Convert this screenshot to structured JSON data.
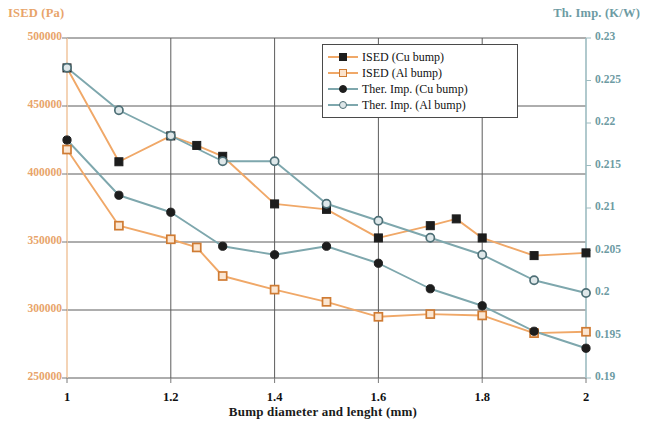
{
  "left_axis": {
    "title": "ISED (Pa)",
    "color": "#e8a46a",
    "ticks": [
      "500000",
      "450000",
      "400000",
      "350000",
      "300000",
      "250000"
    ]
  },
  "right_axis": {
    "title": "Th. Imp. (K/W)",
    "color": "#6d9ba3",
    "ticks": [
      "0.23",
      "0.225",
      "0.22",
      "0.215",
      "0.21",
      "0.205",
      "0.2",
      "0.195",
      "0.19"
    ]
  },
  "x_axis": {
    "title": "Bump diameter and lenght (mm)",
    "ticks": [
      "1",
      "1.2",
      "1.4",
      "1.6",
      "1.8",
      "2"
    ]
  },
  "legend": {
    "items": [
      {
        "label": "ISED (Cu bump)",
        "line": "#f0a868",
        "marker": "square-filled"
      },
      {
        "label": "ISED (Al bump)",
        "line": "#f0a868",
        "marker": "square-open"
      },
      {
        "label": "Ther. Imp. (Cu bump)",
        "line": "#7ea7ad",
        "marker": "circle-filled"
      },
      {
        "label": "Ther. Imp. (Al bump)",
        "line": "#7ea7ad",
        "marker": "circle-open"
      }
    ]
  },
  "chart_data": {
    "type": "line",
    "title": "",
    "xlabel": "Bump diameter and lenght (mm)",
    "ylabel": "ISED (Pa)",
    "y2label": "Th. Imp. (K/W)",
    "xlim": [
      1,
      2
    ],
    "ylim": [
      250000,
      500000
    ],
    "y2lim": [
      0.19,
      0.23
    ],
    "ytick_step": 50000,
    "y2tick_step": 0.005,
    "xticks": [
      1,
      1.2,
      1.4,
      1.6,
      1.8,
      2
    ],
    "grid": true,
    "legend_position": "top-right-inside",
    "series": [
      {
        "name": "ISED (Cu bump)",
        "axis": "left",
        "color": "#f0a868",
        "marker": "square-filled",
        "x": [
          1,
          1.1,
          1.2,
          1.25,
          1.3,
          1.4,
          1.5,
          1.6,
          1.7,
          1.75,
          1.8,
          1.9,
          2
        ],
        "values": [
          478000,
          409000,
          428000,
          421000,
          413000,
          378000,
          374000,
          353000,
          362000,
          367000,
          353000,
          340000,
          342000
        ]
      },
      {
        "name": "ISED (Al bump)",
        "axis": "left",
        "color": "#f0a868",
        "marker": "square-open",
        "x": [
          1,
          1.1,
          1.2,
          1.25,
          1.3,
          1.4,
          1.5,
          1.6,
          1.7,
          1.8,
          1.9,
          2
        ],
        "values": [
          418000,
          362000,
          352000,
          346000,
          325000,
          315000,
          306000,
          295000,
          297000,
          296000,
          283000,
          284000
        ]
      },
      {
        "name": "Ther. Imp. (Cu bump)",
        "axis": "right",
        "color": "#7ea7ad",
        "marker": "circle-filled",
        "x": [
          1,
          1.1,
          1.2,
          1.3,
          1.4,
          1.5,
          1.6,
          1.7,
          1.8,
          1.9,
          2
        ],
        "values": [
          0.218,
          0.2115,
          0.2095,
          0.2055,
          0.2045,
          0.2055,
          0.2035,
          0.2005,
          0.1985,
          0.1955,
          0.1935
        ]
      },
      {
        "name": "Ther. Imp. (Al bump)",
        "axis": "right",
        "color": "#7ea7ad",
        "marker": "circle-open",
        "x": [
          1,
          1.1,
          1.2,
          1.3,
          1.4,
          1.5,
          1.6,
          1.7,
          1.8,
          1.9,
          2
        ],
        "values": [
          0.2265,
          0.2215,
          0.2185,
          0.2155,
          0.2155,
          0.2105,
          0.2085,
          0.2065,
          0.2045,
          0.2015,
          0.2
        ]
      }
    ]
  }
}
